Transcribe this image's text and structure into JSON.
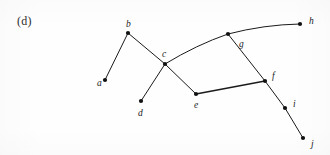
{
  "figure": {
    "panel_label": "(d)",
    "caption_visible": false,
    "width": 330,
    "height": 155,
    "background_color": "#fefefe",
    "ink_color": "#1b1b1b"
  },
  "chart_data": {
    "type": "diagram",
    "diagram_kind": "node-link-graph",
    "title": "(d)",
    "xlabel": "",
    "ylabel": "",
    "grid": false,
    "legend": null,
    "nodes": [
      {
        "id": "a",
        "label": "a",
        "x": 105,
        "y": 80,
        "label_x": 97,
        "label_y": 86
      },
      {
        "id": "b",
        "label": "b",
        "x": 128,
        "y": 33,
        "label_x": 126,
        "label_y": 27
      },
      {
        "id": "c",
        "label": "c",
        "x": 165,
        "y": 64,
        "label_x": 162,
        "label_y": 57
      },
      {
        "id": "d",
        "label": "d",
        "x": 141,
        "y": 101,
        "label_x": 138,
        "label_y": 116
      },
      {
        "id": "e",
        "label": "e",
        "x": 196,
        "y": 94,
        "label_x": 194,
        "label_y": 108
      },
      {
        "id": "f",
        "label": "f",
        "x": 265,
        "y": 81,
        "label_x": 272,
        "label_y": 79
      },
      {
        "id": "g",
        "label": "g",
        "x": 228,
        "y": 34,
        "label_x": 239,
        "label_y": 47
      },
      {
        "id": "h",
        "label": "h",
        "x": 300,
        "y": 24,
        "label_x": 309,
        "label_y": 24
      },
      {
        "id": "i",
        "label": "i",
        "x": 285,
        "y": 108,
        "label_x": 293,
        "label_y": 107
      },
      {
        "id": "j",
        "label": "j",
        "x": 303,
        "y": 138,
        "label_x": 311,
        "label_y": 147
      }
    ],
    "edges": [
      {
        "from": "a",
        "to": "b",
        "curved": false,
        "width": 1.0
      },
      {
        "from": "b",
        "to": "c",
        "curved": false,
        "width": 1.0
      },
      {
        "from": "c",
        "to": "d",
        "curved": false,
        "width": 1.0
      },
      {
        "from": "c",
        "to": "e",
        "curved": false,
        "width": 1.0
      },
      {
        "from": "c",
        "to": "g",
        "curved": true,
        "width": 1.0
      },
      {
        "from": "g",
        "to": "h",
        "curved": true,
        "width": 1.0
      },
      {
        "from": "g",
        "to": "f",
        "curved": false,
        "width": 1.0
      },
      {
        "from": "e",
        "to": "f",
        "curved": false,
        "width": 1.4
      },
      {
        "from": "f",
        "to": "i",
        "curved": false,
        "width": 1.0
      },
      {
        "from": "i",
        "to": "j",
        "curved": false,
        "width": 1.0
      }
    ],
    "node_radius": 2.1,
    "node_count": 10,
    "edge_count": 10
  }
}
